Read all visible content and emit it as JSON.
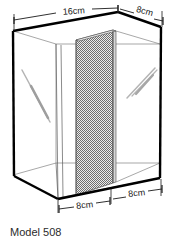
{
  "figure": {
    "title": "Model 508",
    "object_name": "divided-glass-tank",
    "caption": "Model 508",
    "colors": {
      "outline": "#000000",
      "inner_line": "#4a4a4a",
      "hatch": "#7d7d7d",
      "hatch_fill": "#e8e8e8",
      "dimension_line": "#1a1a1a",
      "text": "#2b2b2b",
      "background": "#ffffff",
      "highlight": "#b0b0b0"
    },
    "dimensions": [
      {
        "id": "top-left-width",
        "label": "16cm",
        "value": 16,
        "unit": "cm",
        "position": "top-left",
        "edge": "front-top-width"
      },
      {
        "id": "top-right-depth",
        "label": "8cm",
        "value": 8,
        "unit": "cm",
        "position": "top-right",
        "edge": "top-depth"
      },
      {
        "id": "bottom-left-seg",
        "label": "8cm",
        "value": 8,
        "unit": "cm",
        "position": "bottom-left",
        "edge": "front-bottom-left-half"
      },
      {
        "id": "bottom-right-seg",
        "label": "8cm",
        "value": 8,
        "unit": "cm",
        "position": "bottom-right",
        "edge": "front-bottom-right-half"
      }
    ],
    "parts": [
      {
        "name": "outer-box",
        "description": "transparent rectangular tank drawn in isometric view"
      },
      {
        "name": "divider-panel",
        "description": "hatched vertical partition splitting the tank"
      },
      {
        "name": "glass-highlight-left",
        "description": "diagonal reflection strokes on left face"
      },
      {
        "name": "glass-highlight-right",
        "description": "diagonal reflection strokes on right face"
      }
    ]
  }
}
